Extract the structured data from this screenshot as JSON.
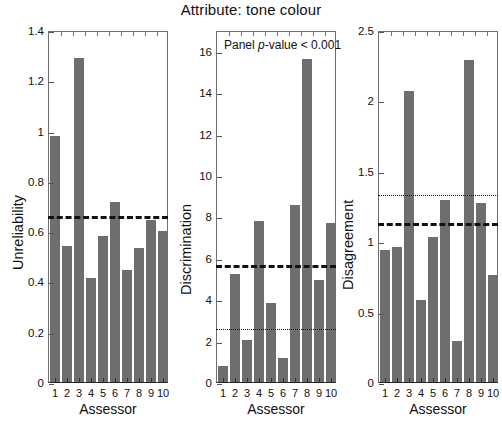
{
  "figure": {
    "title": "Attribute: tone colour",
    "x_axis_title": "Assessor",
    "annotation_prefix": "Panel ",
    "annotation_italic": "p",
    "annotation_suffix": "-value < 0.001",
    "bar_color": "#6e6e6e",
    "line_color": "#111111",
    "axis_color": "#6f6f6f"
  },
  "chart_data": [
    {
      "type": "bar",
      "title": "Attribute: tone colour",
      "panel": "Unreliability",
      "xlabel": "Assessor",
      "ylabel": "Unreliability",
      "categories": [
        "1",
        "2",
        "3",
        "4",
        "5",
        "6",
        "7",
        "8",
        "9",
        "10"
      ],
      "values": [
        0.98,
        0.54,
        1.29,
        0.415,
        0.58,
        0.715,
        0.445,
        0.535,
        0.645,
        0.6
      ],
      "ylim": [
        0,
        1.4
      ],
      "yticks": [
        0,
        0.2,
        0.4,
        0.6,
        0.8,
        1.0,
        1.2,
        1.4
      ],
      "ytick_labels": [
        "0",
        "0.2",
        "0.4",
        "0.6",
        "0.8",
        "1",
        "1.2",
        "1.4"
      ],
      "reference_lines": [
        {
          "style": "dashed",
          "value": 0.67
        }
      ],
      "grid": false,
      "legend": "none"
    },
    {
      "type": "bar",
      "title": "Attribute: tone colour",
      "panel": "Discrimination",
      "xlabel": "Assessor",
      "ylabel": "Discrimination",
      "categories": [
        "1",
        "2",
        "3",
        "4",
        "5",
        "6",
        "7",
        "8",
        "9",
        "10"
      ],
      "values": [
        0.75,
        5.2,
        2.05,
        7.8,
        3.8,
        1.15,
        8.55,
        15.6,
        4.95,
        7.7
      ],
      "ylim": [
        0,
        17.0
      ],
      "yticks": [
        0,
        2,
        4,
        6,
        8,
        10,
        12,
        14,
        16
      ],
      "ytick_labels": [
        "0",
        "2",
        "4",
        "6",
        "8",
        "10",
        "12",
        "14",
        "16"
      ],
      "reference_lines": [
        {
          "style": "dashed",
          "value": 5.75
        },
        {
          "style": "dotted",
          "value": 2.65
        }
      ],
      "annotation": "Panel p-value < 0.001",
      "grid": false,
      "legend": "none"
    },
    {
      "type": "bar",
      "title": "Attribute: tone colour",
      "panel": "Disagreement",
      "xlabel": "Assessor",
      "ylabel": "Disagreement",
      "categories": [
        "1",
        "2",
        "3",
        "4",
        "5",
        "6",
        "7",
        "8",
        "9",
        "10"
      ],
      "values": [
        0.94,
        0.96,
        2.07,
        0.58,
        1.03,
        1.29,
        0.29,
        2.29,
        1.27,
        0.76
      ],
      "ylim": [
        0,
        2.5
      ],
      "yticks": [
        0,
        0.5,
        1.0,
        1.5,
        2.0,
        2.5
      ],
      "ytick_labels": [
        "0",
        "0.5",
        "1",
        "1.5",
        "2",
        "2.5"
      ],
      "reference_lines": [
        {
          "style": "dashed",
          "value": 1.14
        },
        {
          "style": "dotted",
          "value": 1.34
        }
      ],
      "grid": false,
      "legend": "none"
    }
  ]
}
